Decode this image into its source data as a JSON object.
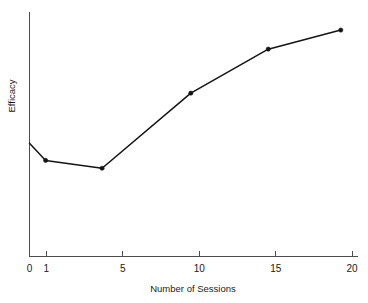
{
  "chart_data": {
    "type": "line",
    "title": "",
    "xlabel": "Number of Sessions",
    "ylabel": "Efficacy",
    "xlim": [
      0,
      21.5
    ],
    "ylim": [
      0,
      1
    ],
    "grid": false,
    "legend": false,
    "legend_position": "none",
    "x_tick_labels": [
      "0",
      "1",
      "5",
      "10",
      "15",
      "20"
    ],
    "x_tick_values": [
      0,
      1,
      5,
      10,
      15,
      20
    ],
    "y_tick_labels": [],
    "y_tick_values": [],
    "y_axis_note": "unlabeled / unitless ordinal scale",
    "marker_style": "filled-circle",
    "line_color": "#141414",
    "axis_color": "#4d4d4d",
    "background_color": "#ffffff",
    "series": [
      {
        "name": "Efficacy",
        "x": [
          0,
          1,
          4.5,
          10,
          14.8,
          19.3
        ],
        "values": [
          0.463,
          0.393,
          0.361,
          0.668,
          0.848,
          0.926
        ],
        "markers_shown": [
          false,
          true,
          true,
          true,
          true,
          true
        ]
      }
    ]
  },
  "axis": {
    "x_title": "Number of Sessions",
    "y_title": "Efficacy"
  },
  "ticks": {
    "x": [
      {
        "label": "0",
        "value": 0
      },
      {
        "label": "1",
        "value": 1
      },
      {
        "label": "5",
        "value": 5
      },
      {
        "label": "10",
        "value": 10
      },
      {
        "label": "15",
        "value": 15
      },
      {
        "label": "20",
        "value": 20
      }
    ]
  }
}
